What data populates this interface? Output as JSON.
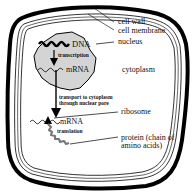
{
  "diagram": {
    "colors": {
      "nucleus_fill": "#d4d4d4",
      "outline": "#000000",
      "background": "#ffffff"
    },
    "labels": {
      "cell_wall": "cell wall",
      "cell_membrane": "cell membrane",
      "nucleus": "nucleus",
      "cytoplasm": "cytoplasm",
      "ribosome": "ribosome",
      "protein_line1": "protein (chain of",
      "protein_line2": "amino acids)"
    },
    "inner_labels": {
      "dna": "DNA",
      "transcription": "transcription",
      "mrna_nucleus": "mRNA",
      "transport_line1": "transport to cytoplasm",
      "transport_line2": "through nuclear pore",
      "mrna_cytoplasm": "mRNA",
      "translation": "translation"
    }
  }
}
